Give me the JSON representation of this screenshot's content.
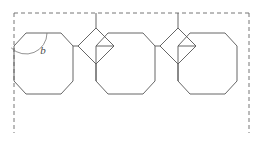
{
  "figure": {
    "canvas": {
      "width": 264,
      "height": 143,
      "background": "#ffffff"
    },
    "style": {
      "solid_stroke_color": "#555555",
      "solid_stroke_width": 0.9,
      "dashed_stroke_color": "#666666",
      "dashed_stroke_width": 0.9,
      "dash_pattern": "4,3",
      "arc_stroke_color": "#777777",
      "arc_stroke_width": 0.8,
      "shape_fill": "none"
    },
    "labels": [
      {
        "name": "angle-label-b",
        "text": "b",
        "x": 43,
        "y": 54,
        "color": "#4a4a4a"
      }
    ],
    "dashed_border": {
      "name": "dashed-boundary",
      "segments": [
        {
          "name": "dashed-top-edge",
          "x1": 14,
          "y1": 13,
          "x2": 249,
          "y2": 13
        },
        {
          "name": "dashed-left-edge",
          "x1": 14,
          "y1": 13,
          "x2": 14,
          "y2": 133
        },
        {
          "name": "dashed-right-edge",
          "x1": 249,
          "y1": 13,
          "x2": 249,
          "y2": 133
        }
      ]
    },
    "octagons": [
      {
        "name": "octagon-left",
        "points": "14,46 26,33 61,33 73,46 73,81 61,94 26,94 14,81"
      },
      {
        "name": "octagon-middle",
        "points": "96,46 108,33 143,33 155,46 155,81 143,94 108,94 96,81"
      },
      {
        "name": "octagon-right",
        "points": "178,46 190,33 225,33 237,46 237,81 225,94 190,94 178,81"
      }
    ],
    "squares": [
      {
        "name": "square-diamond-left",
        "points": "78,46 96,28 114,46 96,64",
        "apex_touches_border": true
      },
      {
        "name": "square-diamond-right",
        "points": "160,46 178,28 196,46 178,64",
        "apex_touches_border": true
      }
    ],
    "angle_arc": {
      "name": "angle-arc-b",
      "vertex_x": 26,
      "vertex_y": 33,
      "radius": 21,
      "path": "M 47,33 A 21,21 0 0 1 11.15,47.85"
    }
  }
}
